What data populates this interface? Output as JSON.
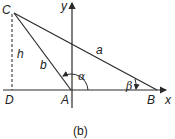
{
  "figure": {
    "caption": "(b)",
    "points": {
      "C": {
        "label": "C",
        "x": 14,
        "y": 13
      },
      "D": {
        "label": "D",
        "x": 11,
        "y": 90
      },
      "A": {
        "label": "A",
        "x": 71,
        "y": 90
      },
      "B": {
        "label": "B",
        "x": 157,
        "y": 90
      }
    },
    "sides": {
      "a": "a",
      "b": "b",
      "h": "h"
    },
    "angles": {
      "alpha": "α",
      "beta": "β"
    },
    "axes": {
      "x": "x",
      "y": "y"
    },
    "colors": {
      "stroke": "#2a2a2a",
      "dashed": "#555555"
    }
  }
}
